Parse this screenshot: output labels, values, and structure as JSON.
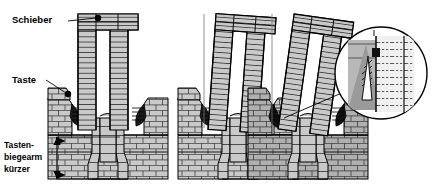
{
  "figure": {
    "type": "technical-cross-section",
    "background_color": "#ffffff",
    "line_color": "#000000",
    "fill_gray": "#c9c9c9",
    "fill_gray_dark": "#a8a8a8",
    "fill_white": "#ffffff"
  },
  "labels": {
    "slider": "Schieber",
    "key": "Taste",
    "dimension_line1": "Tasten-",
    "dimension_line2": "biegearm",
    "dimension_line3": "kürzer"
  },
  "markers": {
    "slider_dot": "callout-dot",
    "key_dot": "callout-dot",
    "dimension_arrow": "double-headed-vertical-arrow",
    "detail_circle": "magnified-detail-callout"
  },
  "panels": [
    {
      "id": "panel-1",
      "state": "slider-upright",
      "tilt_deg": 0
    },
    {
      "id": "panel-2",
      "state": "slider-tilted",
      "tilt_deg": 4
    },
    {
      "id": "panel-3",
      "state": "slider-tilted-max",
      "tilt_deg": 8
    }
  ],
  "detail": {
    "id": "detail-circle",
    "shows": "contact-engagement-zone",
    "hatch_style": "dashed"
  }
}
